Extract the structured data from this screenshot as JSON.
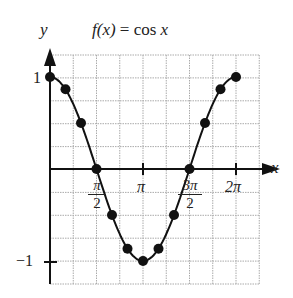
{
  "chart_data": {
    "type": "line",
    "title": "f(x) = cos x",
    "xlabel": "x",
    "ylabel": "y",
    "x_tick_labels": [
      "π/2",
      "π",
      "3π/2",
      "2π"
    ],
    "y_tick_labels": [
      "1",
      "−1"
    ],
    "xlim": [
      0,
      6.2832
    ],
    "ylim": [
      -1.25,
      1.25
    ],
    "grid": true,
    "points": [
      {
        "x": 0,
        "y": 1
      },
      {
        "x": 0.5236,
        "y": 0.866
      },
      {
        "x": 1.0472,
        "y": 0.5
      },
      {
        "x": 1.5708,
        "y": 0
      },
      {
        "x": 2.0944,
        "y": -0.5
      },
      {
        "x": 2.618,
        "y": -0.866
      },
      {
        "x": 3.1416,
        "y": -1
      },
      {
        "x": 3.6652,
        "y": -0.866
      },
      {
        "x": 4.1888,
        "y": -0.5
      },
      {
        "x": 4.7124,
        "y": 0
      },
      {
        "x": 5.236,
        "y": 0.5
      },
      {
        "x": 5.7596,
        "y": 0.866
      },
      {
        "x": 6.2832,
        "y": 1
      }
    ]
  },
  "labels": {
    "title_fx": "f(x)",
    "title_eq": " = cos ",
    "title_x": "x",
    "y_axis": "y",
    "x_axis": "x",
    "y_one": "1",
    "y_neg_one": "−1",
    "pi_half_num": "π",
    "pi_half_den": "2",
    "pi": "π",
    "three_pi_half_num": "3π",
    "three_pi_half_den": "2",
    "two_pi": "2π"
  }
}
